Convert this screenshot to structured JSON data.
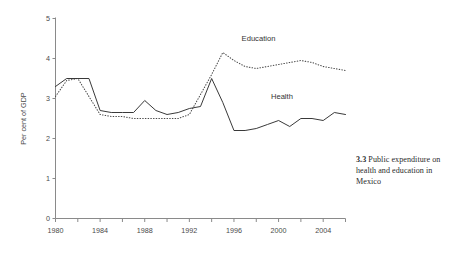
{
  "figure": {
    "caption_number": "3.3",
    "caption_text": "Public expenditure on health and education in Mexico"
  },
  "chart_data": {
    "type": "line",
    "title": "",
    "xlabel": "",
    "ylabel": "Per cent of GDP",
    "xlim": [
      1980,
      2006
    ],
    "ylim": [
      0,
      5
    ],
    "grid": false,
    "legend_position": "inline-annotations",
    "y_ticks": [
      0,
      1,
      2,
      3,
      4,
      5
    ],
    "y_tick_labels": [
      "0",
      "1",
      "2",
      "3",
      "4",
      "5"
    ],
    "x_minor_tick_step": 2,
    "x_tick_labels": [
      "1980",
      "1984",
      "1988",
      "1992",
      "1996",
      "2000",
      "2004"
    ],
    "x_tick_values": [
      1980,
      1984,
      1988,
      1992,
      1996,
      2000,
      2004
    ],
    "x": [
      1980,
      1981,
      1982,
      1983,
      1984,
      1985,
      1986,
      1987,
      1988,
      1989,
      1990,
      1991,
      1992,
      1993,
      1994,
      1995,
      1996,
      1997,
      1998,
      1999,
      2000,
      2001,
      2002,
      2003,
      2004,
      2005,
      2006
    ],
    "series": [
      {
        "name": "Education",
        "style": "dotted",
        "color": "#4a4a4a",
        "values": [
          3.05,
          3.45,
          3.5,
          3.05,
          2.6,
          2.55,
          2.55,
          2.5,
          2.5,
          2.5,
          2.5,
          2.5,
          2.6,
          3.1,
          3.6,
          4.15,
          3.95,
          3.8,
          3.75,
          3.8,
          3.85,
          3.9,
          3.95,
          3.9,
          3.8,
          3.75,
          3.7
        ]
      },
      {
        "name": "Health",
        "style": "solid",
        "color": "#2e2e2e",
        "values": [
          3.3,
          3.5,
          3.5,
          3.5,
          2.7,
          2.65,
          2.65,
          2.65,
          2.95,
          2.7,
          2.6,
          2.65,
          2.75,
          2.8,
          3.5,
          2.9,
          2.2,
          2.2,
          2.25,
          2.35,
          2.45,
          2.3,
          2.5,
          2.5,
          2.45,
          2.65,
          2.6
        ]
      }
    ],
    "annotations": [
      {
        "text": "Education",
        "x": 1998.2,
        "y": 4.45
      },
      {
        "text": "Health",
        "x": 2000.3,
        "y": 2.98
      }
    ]
  }
}
